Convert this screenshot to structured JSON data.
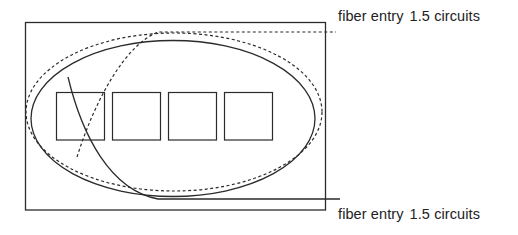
{
  "diagram": {
    "labels": {
      "top": {
        "text": "fiber entry",
        "value": "1.5 circuits"
      },
      "bottom": {
        "text": "fiber entry",
        "value": "1.5 circuits"
      }
    },
    "colors": {
      "stroke": "#2b2b2b",
      "text": "#222222",
      "background": "#ffffff"
    },
    "elements": {
      "enclosure": "rectangle",
      "squares": 4,
      "solid_ring": "ellipse (solid)",
      "dashed_ring": "ellipse (dashed)",
      "top_fiber": "dashed fiber entry path",
      "bottom_fiber": "solid fiber entry path"
    }
  }
}
